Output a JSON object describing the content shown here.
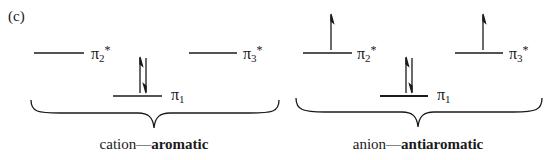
{
  "panel_label": "(c)",
  "left": {
    "orbitals": {
      "pi2_star": {
        "symbol": "π",
        "sub": "2",
        "sup": "*"
      },
      "pi3_star": {
        "symbol": "π",
        "sub": "3",
        "sup": "*"
      },
      "pi1": {
        "symbol": "π",
        "sub": "1"
      }
    },
    "electrons": {
      "pi1": "paired (↑↓)",
      "pi2_star": "empty",
      "pi3_star": "empty"
    },
    "caption_prefix": "cation—",
    "caption_bold": "aromatic"
  },
  "right": {
    "orbitals": {
      "pi2_star": {
        "symbol": "π",
        "sub": "2",
        "sup": "*"
      },
      "pi3_star": {
        "symbol": "π",
        "sub": "3",
        "sup": "*"
      },
      "pi1": {
        "symbol": "π",
        "sub": "1"
      }
    },
    "electrons": {
      "pi1": "paired (↑↓)",
      "pi2_star": "single (↑)",
      "pi3_star": "single (↑)"
    },
    "caption_prefix": "anion—",
    "caption_bold": "antiaromatic"
  },
  "colors": {
    "ink": "#1a1a1a",
    "background": "#ffffff"
  }
}
